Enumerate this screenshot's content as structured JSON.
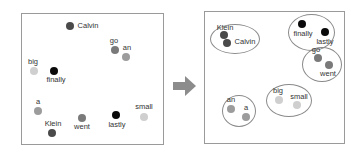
{
  "colors": {
    "black": "#0a0a0a",
    "dark": "#4a4a4a",
    "mid": "#7a7a7a",
    "light": "#9c9c9c",
    "pale": "#cfcfcf",
    "arrow": "#8c8c8c"
  },
  "before": {
    "title": "",
    "words": [
      {
        "word": "Calvin",
        "x": 70,
        "y": 26,
        "shade": "dark"
      },
      {
        "word": "go",
        "x": 115,
        "y": 50,
        "shade": "mid"
      },
      {
        "word": "an",
        "x": 126,
        "y": 57,
        "shade": "light"
      },
      {
        "word": "big",
        "x": 34,
        "y": 71,
        "shade": "pale"
      },
      {
        "word": "finally",
        "x": 54,
        "y": 71,
        "shade": "black"
      },
      {
        "word": "a",
        "x": 38,
        "y": 111,
        "shade": "light"
      },
      {
        "word": "small",
        "x": 144,
        "y": 117,
        "shade": "pale"
      },
      {
        "word": "went",
        "x": 82,
        "y": 118,
        "shade": "mid"
      },
      {
        "word": "lastly",
        "x": 116,
        "y": 115,
        "shade": "black"
      },
      {
        "word": "Klein",
        "x": 52,
        "y": 133,
        "shade": "dark"
      }
    ]
  },
  "after": {
    "clusters": [
      {
        "name": "people",
        "words": [
          "Klein",
          "Calvin"
        ]
      },
      {
        "name": "adverbs",
        "words": [
          "finally",
          "lastly"
        ]
      },
      {
        "name": "verbs",
        "words": [
          "go",
          "went"
        ]
      },
      {
        "name": "articles",
        "words": [
          "an",
          "a"
        ]
      },
      {
        "name": "adjectives",
        "words": [
          "big",
          "small"
        ]
      }
    ],
    "words": [
      {
        "word": "Klein",
        "x": 224,
        "y": 35,
        "shade": "dark"
      },
      {
        "word": "Calvin",
        "x": 227,
        "y": 43,
        "shade": "dark"
      },
      {
        "word": "finally",
        "x": 302,
        "y": 24,
        "shade": "black"
      },
      {
        "word": "lastly",
        "x": 325,
        "y": 32,
        "shade": "black"
      },
      {
        "word": "go",
        "x": 318,
        "y": 58,
        "shade": "mid"
      },
      {
        "word": "went",
        "x": 329,
        "y": 65,
        "shade": "mid"
      },
      {
        "word": "an",
        "x": 231,
        "y": 109,
        "shade": "light"
      },
      {
        "word": "a",
        "x": 246,
        "y": 117,
        "shade": "light"
      },
      {
        "word": "big",
        "x": 279,
        "y": 100,
        "shade": "pale"
      },
      {
        "word": "small",
        "x": 297,
        "y": 105,
        "shade": "pale"
      }
    ]
  }
}
